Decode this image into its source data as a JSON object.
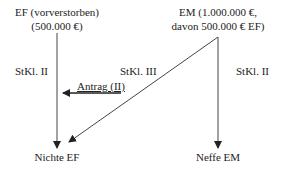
{
  "nodes": {
    "ef": {
      "line1": "EF (vorverstorben)",
      "line2": "(500.000 €)"
    },
    "em": {
      "line1": "EM (1.000.000 €,",
      "line2": "davon 500.000 € EF)"
    },
    "nichte": {
      "label": "Nichte EF"
    },
    "neffe": {
      "label": "Neffe EM"
    }
  },
  "edges": {
    "ef_to_nichte": {
      "label": "StKl. II"
    },
    "em_to_nichte": {
      "label": "StKl. III"
    },
    "em_to_neffe": {
      "label": "StKl. II"
    },
    "antrag": {
      "label": "Antrag (II)"
    }
  },
  "colors": {
    "line": "#333333",
    "text": "#222222"
  }
}
